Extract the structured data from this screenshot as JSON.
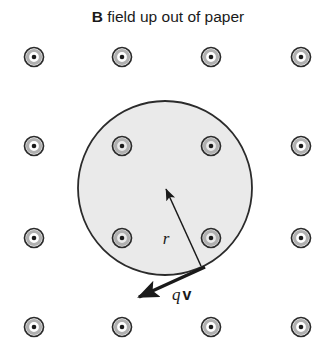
{
  "figure": {
    "width": 334,
    "height": 358,
    "background_color": "#ffffff",
    "title": {
      "bold_part": "B",
      "rest_part": " field up out of paper",
      "full": "B field up out of paper",
      "x": 168,
      "y": 22
    },
    "colors": {
      "ink": "#1a1a1a",
      "disk_fill": "#eaeaea",
      "disk_stroke": "#2b2b2b",
      "dot_ring_outer": "#2b2b2b",
      "dot_ring_inner": "#b0b0b0",
      "dot_center": "#1a1a1a",
      "arrow": "#1a1a1a"
    },
    "disk": {
      "name": "current-carrying-disk",
      "cx": 165,
      "cy": 188,
      "r": 87,
      "fill": "#eaeaea",
      "stroke": "#2b2b2b",
      "stroke_width": 1.8
    },
    "field_symbol": {
      "meaning": "magnetic field out of page",
      "outer_r": 9.5,
      "mid_r": 6.5,
      "center_r": 2.3
    },
    "field_dots": [
      {
        "id": "dot-r1c1",
        "x": 34,
        "y": 57,
        "inside_disk": false
      },
      {
        "id": "dot-r1c2",
        "x": 122,
        "y": 57,
        "inside_disk": false
      },
      {
        "id": "dot-r1c3",
        "x": 211,
        "y": 57,
        "inside_disk": false
      },
      {
        "id": "dot-r1c4",
        "x": 301,
        "y": 57,
        "inside_disk": false
      },
      {
        "id": "dot-r2c1",
        "x": 34,
        "y": 146,
        "inside_disk": false
      },
      {
        "id": "dot-r2c2",
        "x": 122,
        "y": 146,
        "inside_disk": true
      },
      {
        "id": "dot-r2c3",
        "x": 211,
        "y": 146,
        "inside_disk": true
      },
      {
        "id": "dot-r2c4",
        "x": 301,
        "y": 146,
        "inside_disk": false
      },
      {
        "id": "dot-r3c1",
        "x": 34,
        "y": 238,
        "inside_disk": false
      },
      {
        "id": "dot-r3c2",
        "x": 122,
        "y": 238,
        "inside_disk": true
      },
      {
        "id": "dot-r3c3",
        "x": 211,
        "y": 238,
        "inside_disk": true
      },
      {
        "id": "dot-r3c4",
        "x": 301,
        "y": 238,
        "inside_disk": false
      },
      {
        "id": "dot-r4c1",
        "x": 34,
        "y": 327,
        "inside_disk": false
      },
      {
        "id": "dot-r4c2",
        "x": 122,
        "y": 327,
        "inside_disk": false
      },
      {
        "id": "dot-r4c3",
        "x": 211,
        "y": 327,
        "inside_disk": false
      },
      {
        "id": "dot-r4c4",
        "x": 301,
        "y": 327,
        "inside_disk": false
      }
    ],
    "radius_arrow": {
      "name": "radius-vector-arrow",
      "from_x": 201,
      "from_y": 266,
      "to_x": 166,
      "to_y": 189,
      "label": "r",
      "label_x": 166,
      "label_y": 244
    },
    "velocity_arrow": {
      "name": "charge-velocity-arrow",
      "from_x": 205,
      "from_y": 267,
      "to_x": 139,
      "to_y": 297,
      "label_q": "q",
      "label_v": "v",
      "label_x": 172,
      "label_y": 300
    }
  }
}
